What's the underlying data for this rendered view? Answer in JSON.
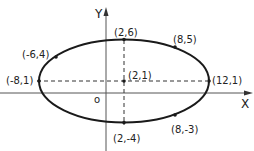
{
  "diagram": {
    "type": "ellipse-plot",
    "colors": {
      "stroke": "#1a1a1a",
      "axis": "#555555",
      "background": "#ffffff"
    },
    "axes": {
      "x_label": "X",
      "y_label": "Y",
      "origin_label": "o"
    },
    "ellipse": {
      "center": [
        2,
        1
      ],
      "semi_major": 10,
      "semi_minor": 5
    },
    "points": [
      {
        "label": "(2,6)",
        "x": 2,
        "y": 6
      },
      {
        "label": "(8,5)",
        "x": 8,
        "y": 5
      },
      {
        "label": "(-6,4)",
        "x": -6,
        "y": 4
      },
      {
        "label": "(-8,1)",
        "x": -8,
        "y": 1
      },
      {
        "label": "(2,1)",
        "x": 2,
        "y": 1
      },
      {
        "label": "(12,1)",
        "x": 12,
        "y": 1
      },
      {
        "label": "(2,-4)",
        "x": 2,
        "y": -4
      },
      {
        "label": "(8,-3)",
        "x": 8,
        "y": -3
      }
    ]
  }
}
